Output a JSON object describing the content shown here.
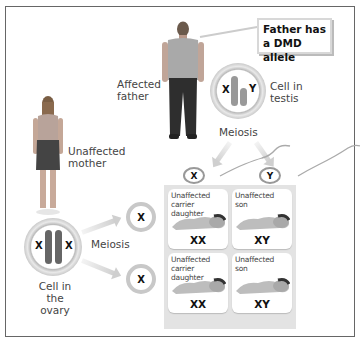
{
  "callout": {
    "line1": "Father has",
    "line2": "a DMD allele"
  },
  "father": {
    "label_line1": "Affected",
    "label_line2": "father"
  },
  "mother": {
    "label_line1": "Unaffected",
    "label_line2": "mother"
  },
  "testis_cell": {
    "label_line1": "Cell in",
    "label_line2": "testis",
    "chromosomes": [
      "X",
      "Y"
    ]
  },
  "ovary_cell": {
    "label_line1": "Cell in",
    "label_line2": "the ovary",
    "chromosomes": [
      "X",
      "X"
    ]
  },
  "meiosis_father": "Meiosis",
  "meiosis_mother": "Meiosis",
  "sperm": [
    {
      "chromosome": "X"
    },
    {
      "chromosome": "Y"
    }
  ],
  "eggs": [
    {
      "chromosome": "X"
    },
    {
      "chromosome": "X"
    }
  ],
  "offspring": [
    {
      "title_line1": "Unaffected",
      "title_line2": "carrier daughter",
      "genotype": "XX"
    },
    {
      "title_line1": "Unaffected",
      "title_line2": "son",
      "genotype": "XY"
    },
    {
      "title_line1": "Unaffected",
      "title_line2": "carrier daughter",
      "genotype": "XX"
    },
    {
      "title_line1": "Unaffected",
      "title_line2": "son",
      "genotype": "XY"
    }
  ],
  "colors": {
    "border": "#666666",
    "panel": "#e3e3e3",
    "text": "#444444",
    "callout_border": "#d8d8d8"
  }
}
